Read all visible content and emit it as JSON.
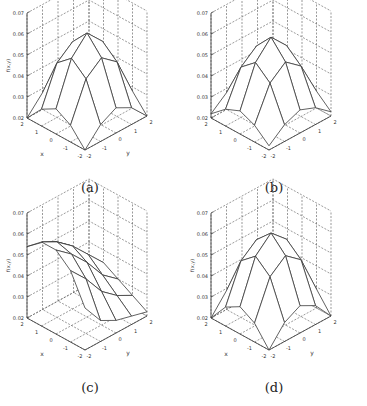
{
  "chart_data": [
    {
      "type": "surface3d",
      "caption": "(a)",
      "xlabel": "x",
      "ylabel": "y",
      "zlabel": "f(x,y)",
      "x": [
        -2,
        -1,
        0,
        1,
        2
      ],
      "y": [
        -2,
        -1,
        0,
        1,
        2
      ],
      "x_ticks": [
        "-2",
        "-1",
        "0",
        "1",
        "2"
      ],
      "y_ticks": [
        "-2",
        "-1",
        "0",
        "1",
        "2"
      ],
      "z_ticks": [
        "0.02",
        "0.03",
        "0.04",
        "0.05",
        "0.06",
        "0.07"
      ],
      "zlim": [
        0.02,
        0.07
      ],
      "grid": true,
      "z": [
        [
          0.02,
          0.028,
          0.032,
          0.028,
          0.02
        ],
        [
          0.028,
          0.046,
          0.052,
          0.046,
          0.028
        ],
        [
          0.032,
          0.052,
          0.06,
          0.052,
          0.032
        ],
        [
          0.028,
          0.046,
          0.052,
          0.046,
          0.028
        ],
        [
          0.02,
          0.028,
          0.032,
          0.028,
          0.02
        ]
      ]
    },
    {
      "type": "surface3d",
      "caption": "(b)",
      "xlabel": "",
      "ylabel": "",
      "zlabel": "",
      "x": [
        -2,
        -1,
        0,
        1,
        2
      ],
      "y": [
        -2,
        -1,
        0,
        1,
        2
      ],
      "x_ticks": [
        "-2",
        "-1",
        "0",
        "1",
        "2"
      ],
      "y_ticks": [
        "-2",
        "-1",
        "0",
        "1",
        "2"
      ],
      "z_ticks": [
        "0.02",
        "0.03",
        "0.04",
        "0.05",
        "0.06",
        "0.07"
      ],
      "zlim": [
        0.02,
        0.07
      ],
      "grid": true,
      "z": [
        [
          0.022,
          0.028,
          0.031,
          0.028,
          0.022
        ],
        [
          0.028,
          0.044,
          0.05,
          0.044,
          0.028
        ],
        [
          0.031,
          0.05,
          0.058,
          0.05,
          0.031
        ],
        [
          0.028,
          0.044,
          0.05,
          0.044,
          0.028
        ],
        [
          0.022,
          0.028,
          0.031,
          0.028,
          0.022
        ]
      ]
    },
    {
      "type": "surface3d",
      "caption": "(c)",
      "xlabel": "x",
      "ylabel": "y",
      "zlabel": "f(x,y)",
      "x": [
        -2,
        -1,
        0,
        1,
        2
      ],
      "y": [
        -2,
        -1,
        0,
        1,
        2
      ],
      "x_ticks": [
        "-2",
        "-1",
        "0",
        "1",
        "2"
      ],
      "y_ticks": [
        "-2",
        "-1",
        "0",
        "1",
        "2"
      ],
      "z_ticks": [
        "0.02",
        "0.03",
        "0.04",
        "0.05",
        "0.06",
        "0.07"
      ],
      "zlim": [
        0.02,
        0.07
      ],
      "grid": true,
      "z": [
        [
          0.04,
          0.03,
          0.026,
          0.024,
          0.022
        ],
        [
          0.054,
          0.046,
          0.036,
          0.03,
          0.026
        ],
        [
          0.06,
          0.054,
          0.046,
          0.036,
          0.03
        ],
        [
          0.06,
          0.056,
          0.05,
          0.042,
          0.034
        ],
        [
          0.054,
          0.052,
          0.048,
          0.04,
          0.032
        ]
      ]
    },
    {
      "type": "surface3d",
      "caption": "(d)",
      "xlabel": "x",
      "ylabel": "y",
      "zlabel": "f(x,y)",
      "x": [
        -2,
        -1,
        0,
        1,
        2
      ],
      "y": [
        -2,
        -1,
        0,
        1,
        2
      ],
      "x_ticks": [
        "-2",
        "-1",
        "0",
        "1",
        "2"
      ],
      "y_ticks": [
        "-2",
        "-1",
        "0",
        "1",
        "2"
      ],
      "z_ticks": [
        "0.02",
        "0.03",
        "0.04",
        "0.05",
        "0.06",
        "0.07"
      ],
      "zlim": [
        0.02,
        0.07
      ],
      "grid": true,
      "z": [
        [
          0.02,
          0.029,
          0.033,
          0.029,
          0.02
        ],
        [
          0.029,
          0.047,
          0.053,
          0.047,
          0.029
        ],
        [
          0.033,
          0.053,
          0.06,
          0.053,
          0.033
        ],
        [
          0.029,
          0.047,
          0.053,
          0.047,
          0.029
        ],
        [
          0.02,
          0.029,
          0.033,
          0.029,
          0.02
        ]
      ]
    }
  ]
}
